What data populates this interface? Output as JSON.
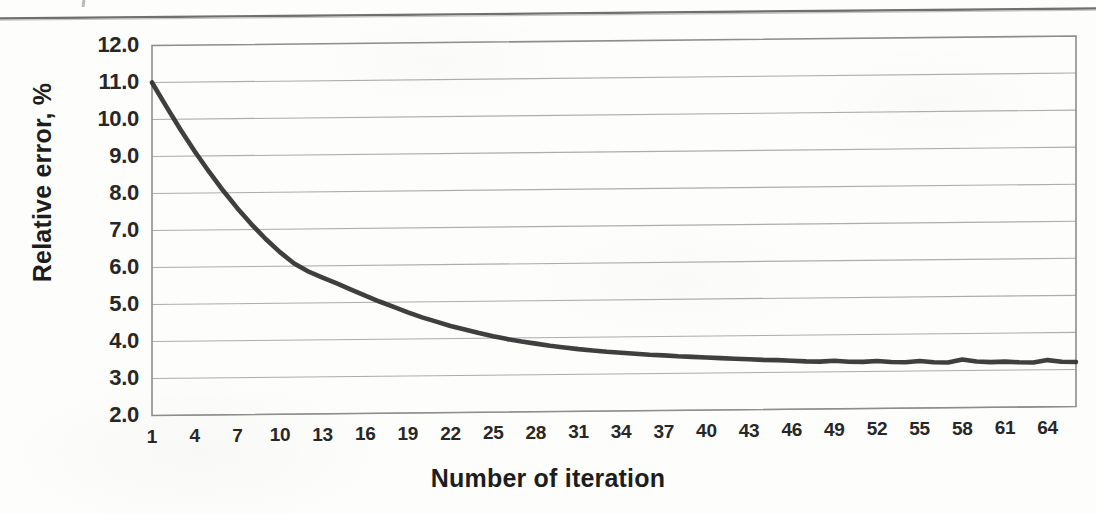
{
  "chart_data": {
    "type": "line",
    "title": "",
    "xlabel": "Number of iteration",
    "ylabel": "Relative error, %",
    "xlim": [
      1,
      66
    ],
    "ylim": [
      2.0,
      12.0
    ],
    "grid": true,
    "legend": "none",
    "line_color": "#2f2f2f",
    "gridline_color": "#a9a9a9",
    "frame_color": "#8d8d8d",
    "background_color": "#fdfdfc",
    "ytick_labels": [
      "12.0",
      "11.0",
      "10.0",
      "9.0",
      "8.0",
      "7.0",
      "6.0",
      "5.0",
      "4.0",
      "3.0",
      "2.0"
    ],
    "ytick_values": [
      12.0,
      11.0,
      10.0,
      9.0,
      8.0,
      7.0,
      6.0,
      5.0,
      4.0,
      3.0,
      2.0
    ],
    "xtick_labels": [
      "1",
      "4",
      "7",
      "10",
      "13",
      "16",
      "19",
      "22",
      "25",
      "28",
      "31",
      "34",
      "37",
      "40",
      "43",
      "46",
      "49",
      "52",
      "55",
      "58",
      "61",
      "64"
    ],
    "xtick_values": [
      1,
      4,
      7,
      10,
      13,
      16,
      19,
      22,
      25,
      28,
      31,
      34,
      37,
      40,
      43,
      46,
      49,
      52,
      55,
      58,
      61,
      64
    ],
    "series": [
      {
        "name": "Relative error",
        "x": [
          1,
          2,
          3,
          4,
          5,
          6,
          7,
          8,
          9,
          10,
          11,
          12,
          13,
          14,
          15,
          16,
          17,
          18,
          19,
          20,
          21,
          22,
          23,
          24,
          25,
          26,
          27,
          28,
          29,
          30,
          31,
          32,
          33,
          34,
          35,
          36,
          37,
          38,
          39,
          40,
          41,
          42,
          43,
          44,
          45,
          46,
          47,
          48,
          49,
          50,
          51,
          52,
          53,
          54,
          55,
          56,
          57,
          58,
          59,
          60,
          61,
          62,
          63,
          64,
          65,
          66
        ],
        "values": [
          11.0,
          10.35,
          9.72,
          9.13,
          8.58,
          8.06,
          7.58,
          7.14,
          6.74,
          6.38,
          6.07,
          5.85,
          5.68,
          5.52,
          5.35,
          5.18,
          5.02,
          4.87,
          4.72,
          4.58,
          4.46,
          4.34,
          4.24,
          4.14,
          4.05,
          3.97,
          3.9,
          3.84,
          3.78,
          3.73,
          3.68,
          3.64,
          3.6,
          3.57,
          3.54,
          3.51,
          3.49,
          3.46,
          3.44,
          3.42,
          3.4,
          3.38,
          3.36,
          3.34,
          3.33,
          3.31,
          3.29,
          3.28,
          3.3,
          3.27,
          3.26,
          3.28,
          3.25,
          3.24,
          3.27,
          3.23,
          3.22,
          3.3,
          3.24,
          3.22,
          3.23,
          3.21,
          3.2,
          3.26,
          3.21,
          3.2
        ]
      }
    ]
  },
  "axes": {
    "ylabel": "Relative error, %",
    "xlabel": "Number of iteration"
  },
  "icons": {
    "scan_rule": "horizontal-rule"
  }
}
